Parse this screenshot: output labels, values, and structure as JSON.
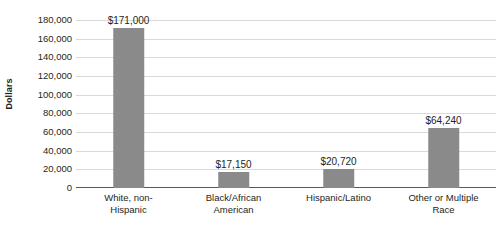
{
  "chart_data": {
    "type": "bar",
    "title": "",
    "subtitle": "",
    "xlabel": "",
    "ylabel": "Dollars",
    "ylim": [
      0,
      180000
    ],
    "ytick_step": 20000,
    "grid": true,
    "legend": false,
    "bar_color": "#8a8a8a",
    "categories": [
      "White, non-Hispanic",
      "Black/African American",
      "Hispanic/Latino",
      "Other or Multiple Race"
    ],
    "category_lines": [
      [
        "White, non-",
        "Hispanic"
      ],
      [
        "Black/African",
        "American"
      ],
      [
        "Hispanic/Latino",
        ""
      ],
      [
        "Other or Multiple",
        "Race"
      ]
    ],
    "values": [
      171000,
      17150,
      20720,
      64240
    ],
    "data_labels": [
      "$171,000",
      "$17,150",
      "$20,720",
      "$64,240"
    ],
    "ytick_labels": [
      "180,000",
      "160,000",
      "140,000",
      "120,000",
      "100,000",
      "80,000",
      "60,000",
      "40,000",
      "20,000",
      "0"
    ],
    "ytick_values": [
      180000,
      160000,
      140000,
      120000,
      100000,
      80000,
      60000,
      40000,
      20000,
      0
    ]
  }
}
